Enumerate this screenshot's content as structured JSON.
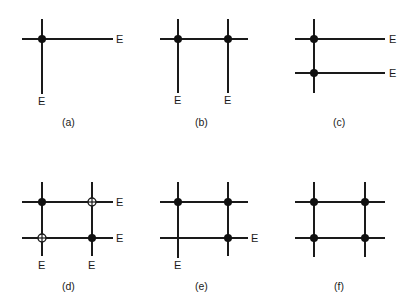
{
  "figure": {
    "end_label": "E",
    "colors": {
      "line": "#1a1a1a",
      "dot": "#111111",
      "background": "#ffffff"
    },
    "panels": [
      {
        "id": "a",
        "caption": "(a)",
        "description": "Single junction with one filled node; right and bottom ends labeled E"
      },
      {
        "id": "b",
        "caption": "(b)",
        "description": "One horizontal line crossing two verticals; two filled nodes; bottom ends labeled E"
      },
      {
        "id": "c",
        "caption": "(c)",
        "description": "One vertical crossing two horizontals; two filled nodes; right ends labeled E"
      },
      {
        "id": "d",
        "caption": "(d)",
        "description": "2x2 grid; filled nodes top-left and bottom-right, open crossed nodes top-right and bottom-left; right and bottom ends labeled E"
      },
      {
        "id": "e",
        "caption": "(e)",
        "description": "2x2 grid; three filled nodes (top-left, top-right, bottom-right); bottom horizontal right end and left vertical bottom end labeled E"
      },
      {
        "id": "f",
        "caption": "(f)",
        "description": "2x2 grid; four filled nodes; no E labels"
      }
    ]
  }
}
